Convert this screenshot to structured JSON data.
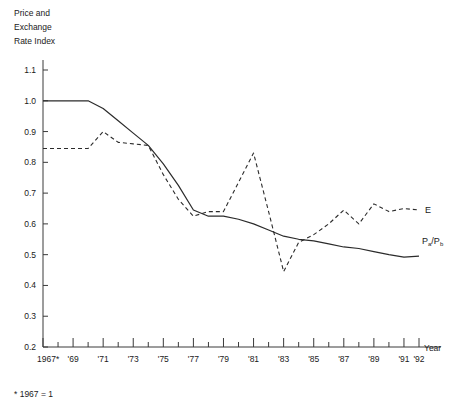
{
  "chart_data": {
    "type": "line",
    "title": "",
    "ylabel": "Price and Exchange Rate Index",
    "xlabel": "Year",
    "footnote": "* 1967 = 1",
    "grid": false,
    "legend_position": "right-inline",
    "ylim": [
      0.2,
      1.1
    ],
    "yticks": [
      "1.1",
      "1.0",
      "0.9",
      "0.8",
      "0.7",
      "0.6",
      "0.5",
      "0.4",
      "0.3",
      "0.2"
    ],
    "ytick_values": [
      1.1,
      1.0,
      0.9,
      0.8,
      0.7,
      0.6,
      0.5,
      0.4,
      0.3,
      0.2
    ],
    "xlim": [
      1967,
      1992
    ],
    "x": [
      1967,
      1968,
      1969,
      1970,
      1971,
      1972,
      1973,
      1974,
      1975,
      1976,
      1977,
      1978,
      1979,
      1980,
      1981,
      1982,
      1983,
      1984,
      1985,
      1986,
      1987,
      1988,
      1989,
      1990,
      1991,
      1992
    ],
    "xticks": [
      1967,
      1968,
      1969,
      1970,
      1971,
      1972,
      1973,
      1974,
      1975,
      1976,
      1977,
      1978,
      1979,
      1980,
      1981,
      1982,
      1983,
      1984,
      1985,
      1986,
      1987,
      1988,
      1989,
      1990,
      1991,
      1992
    ],
    "xtick_labels": [
      {
        "value": 1967,
        "label": "1967*"
      },
      {
        "value": 1969,
        "label": "'69"
      },
      {
        "value": 1971,
        "label": "'71"
      },
      {
        "value": 1973,
        "label": "'73"
      },
      {
        "value": 1975,
        "label": "'75"
      },
      {
        "value": 1977,
        "label": "'77"
      },
      {
        "value": 1979,
        "label": "'79"
      },
      {
        "value": 1981,
        "label": "'81"
      },
      {
        "value": 1983,
        "label": "'83"
      },
      {
        "value": 1985,
        "label": "'85"
      },
      {
        "value": 1987,
        "label": "'87"
      },
      {
        "value": 1989,
        "label": "'89"
      },
      {
        "value": 1991,
        "label": "'91"
      },
      {
        "value": 1992,
        "label": "'92"
      }
    ],
    "series": [
      {
        "name": "Pa/Pb",
        "label_text": "P",
        "label_sub1": "a",
        "label_mid": "/P",
        "label_sub2": "b",
        "style": "solid",
        "label_x": 1992.2,
        "label_y": 0.545,
        "values": [
          1.0,
          1.0,
          1.0,
          1.0,
          0.975,
          0.935,
          0.895,
          0.855,
          0.795,
          0.725,
          0.645,
          0.625,
          0.625,
          0.615,
          0.6,
          0.58,
          0.56,
          0.55,
          0.545,
          0.535,
          0.525,
          0.52,
          0.51,
          0.5,
          0.492,
          0.495
        ]
      },
      {
        "name": "E",
        "label_text": "E",
        "style": "dashed",
        "label_x": 1992.4,
        "label_y": 0.645,
        "values": [
          0.845,
          0.845,
          0.845,
          0.845,
          0.9,
          0.865,
          0.86,
          0.855,
          0.76,
          0.68,
          0.625,
          0.64,
          0.64,
          0.735,
          0.83,
          0.64,
          0.445,
          0.54,
          0.565,
          0.6,
          0.645,
          0.6,
          0.665,
          0.64,
          0.65,
          0.645
        ]
      }
    ]
  }
}
